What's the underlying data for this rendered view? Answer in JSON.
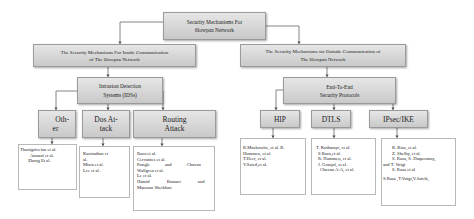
{
  "diagram": {
    "root": {
      "title": "Security Mechanisms For 6lowpan Network",
      "lines": [
        "Security Mechanisms For",
        "6lowpan Network"
      ]
    },
    "branches": [
      {
        "title": "The Security Mechanisms For Inside Communication of The 6lowpan Network",
        "lines": [
          "The Security Mechanisms For Inside Communication",
          "of The 6lowpan Network"
        ],
        "child": {
          "title": "Intrusion Detection Systems (IDSs)",
          "lines": [
            "Intrusion Detection",
            "Systems (IDSs)"
          ],
          "children": [
            {
              "label_lines": [
                "Oth-",
                "er"
              ],
              "label": "Other",
              "refs": [
                "Thanigaivelan et al.",
                "Amaral et al.",
                "Zhang Et al."
              ]
            },
            {
              "label_lines": [
                "Dos At-",
                "tack"
              ],
              "label": "Dos Attack",
              "refs": [
                "Kasinathan et",
                "al.",
                "Misra et al.",
                "Lee et al ."
              ]
            },
            {
              "label_lines": [
                "Routing",
                "Attack"
              ],
              "label": "Routing Attack",
              "refs": [
                "Raza et al.",
                "Cervantes et al.",
                "Pongle and Chavan",
                "Wallgren et al.",
                "Le et al.",
                "Hamid Bostani and",
                "Mansour Sheikhan"
              ]
            }
          ]
        }
      },
      {
        "title": "The Security Mechanisms for Outside Communication of The 6lowpan Network",
        "lines": [
          "The Security Mechanisms for Outside Communication of",
          "The 6lowpan Network"
        ],
        "child": {
          "title": "End-To-End Security Protocols",
          "lines": [
            "End-To-End",
            "Security Protocols"
          ],
          "children": [
            {
              "label": "HIP",
              "refs": [
                "R.Moskowitz, et al. R.",
                "Hummen, et al.",
                "T.Heer, et al.",
                "V.Saied,et al."
              ]
            },
            {
              "label": "DTLS",
              "refs": [
                "T. Kothmayr, et al.",
                "S.Raza,et al.",
                "R. Hummen, et al.",
                "J. Granjal, et al .",
                "Chavan A-A, et al."
              ]
            },
            {
              "label": "IPsec/IKE",
              "refs": [
                "R. Riaz, et al.",
                "Z. Shelby, et al.",
                "S. Raza, S. Duquennoy,",
                "and T. Voigt",
                "S. Raza et al",
                "S.Raza ,T.Voigt,V.Jutvik,"
              ]
            }
          ]
        }
      }
    ]
  },
  "colors": {
    "node_fill_top": "#e6e6e6",
    "node_fill_bottom": "#c9c9c9",
    "line": "#666666",
    "leaf_border": "#b8b8b8"
  }
}
